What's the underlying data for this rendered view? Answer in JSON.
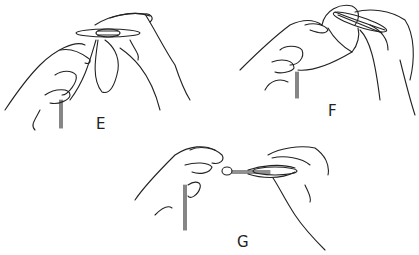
{
  "figure": {
    "panels": [
      {
        "id": "E",
        "label": "E",
        "description": "Hands holding tatting shuttle with thread loop around fingers"
      },
      {
        "id": "F",
        "label": "F",
        "description": "Shuttle passed through loop, thread forming a knot"
      },
      {
        "id": "G",
        "label": "G",
        "description": "Thread pulled taut between shuttle and fingers to close the stitch"
      }
    ]
  }
}
